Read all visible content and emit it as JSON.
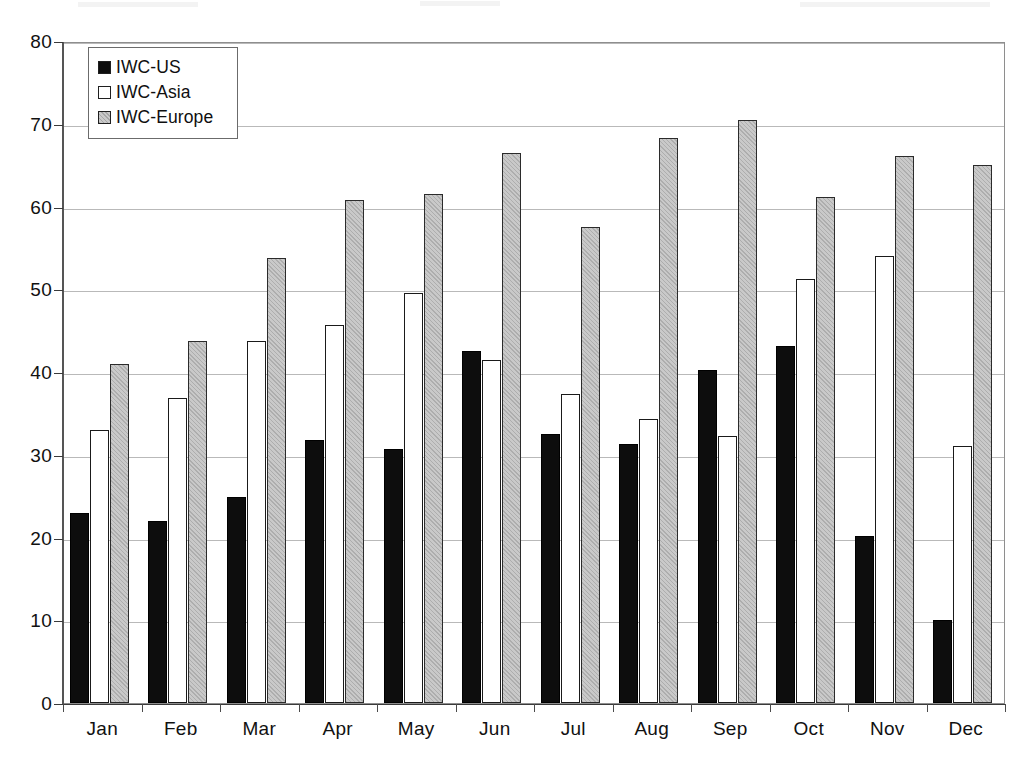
{
  "chart_data": {
    "type": "bar",
    "title": "",
    "xlabel": "",
    "ylabel": "",
    "ylim": [
      0,
      80
    ],
    "ytick_step": 10,
    "yticks": [
      0,
      10,
      20,
      30,
      40,
      50,
      60,
      70,
      80
    ],
    "grid": true,
    "legend_position": "top-left-inside",
    "categories": [
      "Jan",
      "Feb",
      "Mar",
      "Apr",
      "May",
      "Jun",
      "Jul",
      "Aug",
      "Sep",
      "Oct",
      "Nov",
      "Dec"
    ],
    "series": [
      {
        "name": "IWC-US",
        "color": "#0d0d0d",
        "values": [
          23.0,
          22.0,
          24.9,
          31.8,
          30.7,
          42.5,
          32.5,
          31.3,
          40.3,
          43.2,
          20.2,
          10.0
        ]
      },
      {
        "name": "IWC-Asia",
        "color": "#ffffff",
        "values": [
          33.0,
          36.9,
          43.8,
          45.7,
          49.5,
          41.4,
          37.4,
          34.3,
          32.3,
          51.2,
          54.0,
          31.0
        ]
      },
      {
        "name": "IWC-Europe",
        "color": "#c9c9c9",
        "values": [
          41.0,
          43.8,
          53.8,
          60.8,
          61.5,
          66.5,
          57.5,
          68.3,
          70.4,
          61.2,
          66.1,
          65.0
        ]
      }
    ]
  },
  "legend": {
    "items": [
      {
        "label": "IWC-US",
        "swatch": "black-square-icon"
      },
      {
        "label": "IWC-Asia",
        "swatch": "white-square-icon"
      },
      {
        "label": "IWC-Europe",
        "swatch": "gray-square-icon"
      }
    ]
  },
  "caption": {
    "text": ""
  },
  "colors": {
    "us": "#0d0d0d",
    "asia": "#ffffff",
    "europe": "#c9c9c9",
    "grid": "#b9b9b9",
    "axis": "#3a3a3a",
    "frame": "#8e8e8e"
  }
}
